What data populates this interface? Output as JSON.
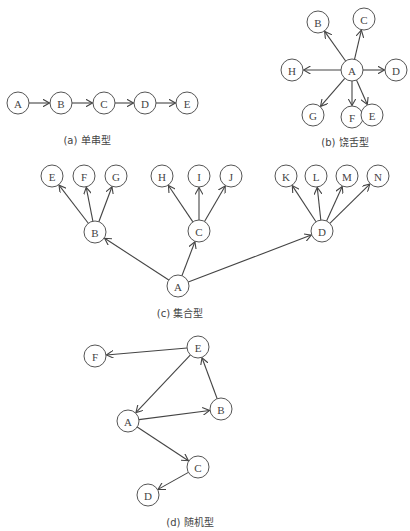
{
  "figures": [
    {
      "id": "a",
      "caption": "(a) 单串型",
      "caption_pos": [
        87,
        132
      ],
      "nodes": [
        {
          "label": "A",
          "x": 18,
          "y": 103
        },
        {
          "label": "B",
          "x": 61,
          "y": 103
        },
        {
          "label": "C",
          "x": 104,
          "y": 103
        },
        {
          "label": "D",
          "x": 145,
          "y": 103
        },
        {
          "label": "E",
          "x": 187,
          "y": 103
        }
      ],
      "edges": [
        [
          "A",
          "B"
        ],
        [
          "B",
          "C"
        ],
        [
          "C",
          "D"
        ],
        [
          "D",
          "E"
        ]
      ]
    },
    {
      "id": "b",
      "caption": "(b) 饶舌型",
      "caption_pos": [
        345,
        134
      ],
      "nodes": [
        {
          "label": "A",
          "x": 352,
          "y": 70
        },
        {
          "label": "B",
          "x": 318,
          "y": 22
        },
        {
          "label": "C",
          "x": 364,
          "y": 19
        },
        {
          "label": "H",
          "x": 292,
          "y": 70
        },
        {
          "label": "D",
          "x": 396,
          "y": 70
        },
        {
          "label": "G",
          "x": 313,
          "y": 115
        },
        {
          "label": "F",
          "x": 352,
          "y": 117
        },
        {
          "label": "E",
          "x": 372,
          "y": 115
        }
      ],
      "edges": [
        [
          "A",
          "B"
        ],
        [
          "A",
          "C"
        ],
        [
          "A",
          "H"
        ],
        [
          "A",
          "D"
        ],
        [
          "A",
          "G"
        ],
        [
          "A",
          "F"
        ],
        [
          "A",
          "E"
        ]
      ]
    },
    {
      "id": "c",
      "caption": "(c) 集合型",
      "caption_pos": [
        180,
        305
      ],
      "nodes": [
        {
          "label": "E",
          "x": 52,
          "y": 176
        },
        {
          "label": "F",
          "x": 84,
          "y": 176
        },
        {
          "label": "G",
          "x": 116,
          "y": 176
        },
        {
          "label": "B",
          "x": 95,
          "y": 232
        },
        {
          "label": "H",
          "x": 162,
          "y": 176
        },
        {
          "label": "I",
          "x": 199,
          "y": 176
        },
        {
          "label": "J",
          "x": 231,
          "y": 176
        },
        {
          "label": "C",
          "x": 199,
          "y": 231
        },
        {
          "label": "K",
          "x": 286,
          "y": 176
        },
        {
          "label": "L",
          "x": 316,
          "y": 176
        },
        {
          "label": "M",
          "x": 347,
          "y": 176
        },
        {
          "label": "N",
          "x": 378,
          "y": 176
        },
        {
          "label": "D",
          "x": 322,
          "y": 231
        },
        {
          "label": "A",
          "x": 178,
          "y": 286
        }
      ],
      "edges": [
        [
          "B",
          "E"
        ],
        [
          "B",
          "F"
        ],
        [
          "B",
          "G"
        ],
        [
          "C",
          "H"
        ],
        [
          "C",
          "I"
        ],
        [
          "C",
          "J"
        ],
        [
          "D",
          "K"
        ],
        [
          "D",
          "L"
        ],
        [
          "D",
          "M"
        ],
        [
          "D",
          "N"
        ],
        [
          "A",
          "B"
        ],
        [
          "A",
          "C"
        ],
        [
          "A",
          "D"
        ]
      ]
    },
    {
      "id": "d",
      "caption": "(d) 随机型",
      "caption_pos": [
        190,
        514
      ],
      "nodes": [
        {
          "label": "F",
          "x": 95,
          "y": 356
        },
        {
          "label": "E",
          "x": 198,
          "y": 347
        },
        {
          "label": "A",
          "x": 128,
          "y": 421
        },
        {
          "label": "B",
          "x": 221,
          "y": 409
        },
        {
          "label": "C",
          "x": 198,
          "y": 467
        },
        {
          "label": "D",
          "x": 148,
          "y": 495
        }
      ],
      "edges": [
        [
          "E",
          "F"
        ],
        [
          "E",
          "A"
        ],
        [
          "B",
          "E"
        ],
        [
          "A",
          "B"
        ],
        [
          "A",
          "C"
        ],
        [
          "C",
          "D"
        ]
      ]
    }
  ],
  "style": {
    "node_radius": 11,
    "stroke": "#444444",
    "background": "#ffffff"
  }
}
